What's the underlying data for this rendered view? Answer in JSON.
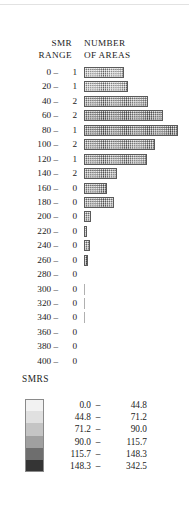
{
  "figure": {
    "headers": {
      "left_line1": "SMR",
      "left_line2": "RANGE",
      "right_line1": "NUMBER",
      "right_line2": "OF AREAS"
    },
    "legend_title": "SMRS"
  },
  "chart_data": {
    "type": "bar",
    "title": "",
    "subtitle": "",
    "xlabel": "NUMBER OF AREAS",
    "ylabel": "SMR RANGE",
    "orientation": "horizontal",
    "grid": false,
    "legend_position": "bottom-left",
    "categories": [
      "0 -",
      "20 -",
      "40 -",
      "60 -",
      "80 -",
      "100 -",
      "120 -",
      "140 -",
      "160 -",
      "180 -",
      "200 -",
      "220 -",
      "240 -",
      "260 -",
      "280 -",
      "300 -",
      "320 -",
      "340 -",
      "360 -",
      "380 -",
      "400 -"
    ],
    "tick_labels": [
      "0 –",
      "20 –",
      "40 –",
      "60 –",
      "80 –",
      "100 –",
      "120 –",
      "140 –",
      "160 –",
      "180 –",
      "200 –",
      "220 –",
      "240 –",
      "260 –",
      "280 –",
      "300 –",
      "320 –",
      "340 –",
      "360 –",
      "380 –",
      "400 –"
    ],
    "number_of_areas": [
      1,
      1,
      2,
      2,
      1,
      2,
      1,
      2,
      0,
      0,
      0,
      0,
      0,
      0,
      0,
      0,
      0,
      0,
      0,
      0,
      0
    ],
    "bar_lengths_px": [
      40,
      44,
      64,
      79,
      94,
      71,
      63,
      33,
      23,
      30,
      7,
      3,
      6,
      4,
      0,
      2,
      1,
      1,
      0,
      0,
      0
    ],
    "bar_shades": [
      "light",
      "light",
      "mid",
      "dark",
      "dark",
      "mid",
      "mid",
      "mid",
      "mid",
      "mid",
      "mid",
      "dark",
      "mid",
      "dark",
      "none",
      "hairline",
      "hairline",
      "hairline",
      "none",
      "none",
      "none"
    ],
    "series": [
      {
        "name": "Number of areas",
        "values": [
          1,
          1,
          2,
          2,
          1,
          2,
          1,
          2,
          0,
          0,
          0,
          0,
          0,
          0,
          0,
          0,
          0,
          0,
          0,
          0,
          0
        ]
      }
    ]
  },
  "legend": {
    "title": "SMRS",
    "entries": [
      {
        "low": "0.0",
        "dash": "–",
        "high": "44.8",
        "color": "#f2f2f2"
      },
      {
        "low": "44.8",
        "dash": "–",
        "high": "71.2",
        "color": "#e0e0e0"
      },
      {
        "low": "71.2",
        "dash": "–",
        "high": "90.0",
        "color": "#c4c4c4"
      },
      {
        "low": "90.0",
        "dash": "–",
        "high": "115.7",
        "color": "#a0a0a0"
      },
      {
        "low": "115.7",
        "dash": "–",
        "high": "148.3",
        "color": "#6e6e6e"
      },
      {
        "low": "148.3",
        "dash": "–",
        "high": "342.5",
        "color": "#343434"
      }
    ]
  }
}
